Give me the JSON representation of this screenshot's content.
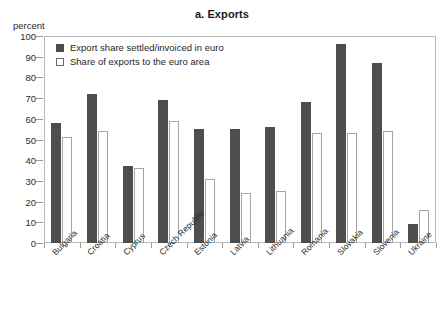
{
  "axis_unit_label": "percent",
  "colors": {
    "dark_series": "#4e4e4e",
    "light_series": "#ffffff",
    "light_series_border": "#a5a5a5",
    "frame": "#b9b9b9",
    "text": "#2b2b2b"
  },
  "chart_data": {
    "type": "bar",
    "title": "a. Exports",
    "xlabel": "",
    "ylabel": "percent",
    "ylim": [
      0,
      100
    ],
    "yticks": [
      0,
      10,
      20,
      30,
      40,
      50,
      60,
      70,
      80,
      90,
      100
    ],
    "grid": false,
    "legend_position": "top-left inside plot",
    "categories": [
      "Bulgaria",
      "Croatia",
      "Cyprus",
      "Czech Republic",
      "Estonia",
      "Latvia",
      "Lithuania",
      "Romania",
      "Slovakia",
      "Slovenia",
      "Ukraine"
    ],
    "series": [
      {
        "name": "Export share settled/invoiced in euro",
        "values": [
          58,
          72,
          37,
          69,
          55,
          55,
          56,
          68,
          96,
          87,
          9
        ]
      },
      {
        "name": "Share of exports to the euro area",
        "values": [
          51,
          54,
          36,
          59,
          31,
          24,
          25,
          53,
          53,
          54,
          16
        ]
      }
    ]
  }
}
